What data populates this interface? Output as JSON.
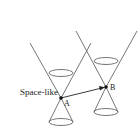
{
  "diagram": {
    "type": "spacetime light cones",
    "events": [
      {
        "id": "A",
        "label": "A",
        "x": 61,
        "y": 98
      },
      {
        "id": "B",
        "label": "B",
        "x": 106,
        "y": 87
      }
    ],
    "separation": {
      "label": "Space-like",
      "from": "A",
      "to": "B"
    },
    "colors": {
      "line": "#555555",
      "point": "#111111",
      "text": "#222222"
    }
  }
}
